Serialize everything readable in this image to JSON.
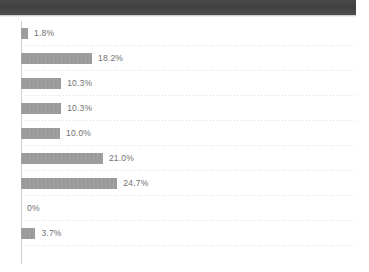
{
  "top_band": {
    "present": true,
    "color": "#464646"
  },
  "chart_data": {
    "type": "bar",
    "orientation": "horizontal",
    "title": "",
    "xlabel": "",
    "ylabel": "",
    "categories": [
      "",
      "",
      "",
      "",
      "",
      "",
      "",
      "",
      ""
    ],
    "values": [
      1.8,
      18.2,
      10.3,
      10.3,
      10.0,
      21.0,
      24.7,
      0,
      3.7
    ],
    "data_labels": [
      "1.8%",
      "18.2%",
      "10.3%",
      "10.3%",
      "10.0%",
      "21.0%",
      "24.7%",
      "0%",
      "3.7%"
    ],
    "xlim": [
      0,
      85
    ],
    "grid": true,
    "grid_orientation": "horizontal",
    "legend": false,
    "bar_color": "#9a9a9a",
    "label_color": "#6f6f6f",
    "gridline_color": "#d8d8d8",
    "axis_color": "#cfcfcf",
    "background": "#ffffff"
  },
  "rows": [
    {
      "label": "1.8%",
      "value": 1.8
    },
    {
      "label": "18.2%",
      "value": 18.2
    },
    {
      "label": "10.3%",
      "value": 10.3
    },
    {
      "label": "10.3%",
      "value": 10.3
    },
    {
      "label": "10.0%",
      "value": 10.0
    },
    {
      "label": "21.0%",
      "value": 21.0
    },
    {
      "label": "24.7%",
      "value": 24.7
    },
    {
      "label": "0%",
      "value": 0
    },
    {
      "label": "3.7%",
      "value": 3.7
    }
  ]
}
